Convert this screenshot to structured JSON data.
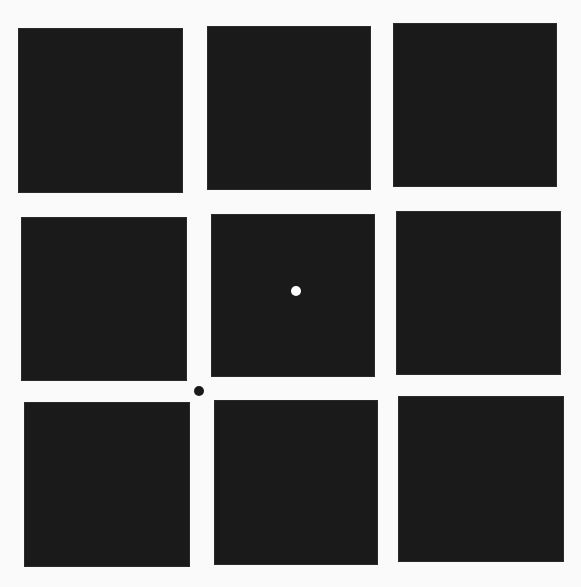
{
  "canvas": {
    "width": 581,
    "height": 587,
    "background": "#fafafa"
  },
  "grid": {
    "rows": 3,
    "cols": 3,
    "square_color": "#1a1a1a",
    "squares": [
      {
        "id": "r1c1",
        "x": 18,
        "y": 28,
        "w": 165,
        "h": 165
      },
      {
        "id": "r1c2",
        "x": 207,
        "y": 26,
        "w": 164,
        "h": 164
      },
      {
        "id": "r1c3",
        "x": 393,
        "y": 23,
        "w": 164,
        "h": 164
      },
      {
        "id": "r2c1",
        "x": 21,
        "y": 217,
        "w": 166,
        "h": 164
      },
      {
        "id": "r2c2",
        "x": 211,
        "y": 214,
        "w": 164,
        "h": 163
      },
      {
        "id": "r2c3",
        "x": 396,
        "y": 211,
        "w": 165,
        "h": 164
      },
      {
        "id": "r3c1",
        "x": 24,
        "y": 402,
        "w": 166,
        "h": 165
      },
      {
        "id": "r3c2",
        "x": 214,
        "y": 400,
        "w": 164,
        "h": 165
      },
      {
        "id": "r3c3",
        "x": 398,
        "y": 396,
        "w": 166,
        "h": 166
      }
    ]
  },
  "dots": [
    {
      "id": "white-fixation-dot",
      "cx": 296,
      "cy": 291,
      "r": 5,
      "color": "#ffffff"
    },
    {
      "id": "black-gap-dot",
      "cx": 199,
      "cy": 391,
      "r": 5,
      "color": "#1a1a1a"
    }
  ]
}
